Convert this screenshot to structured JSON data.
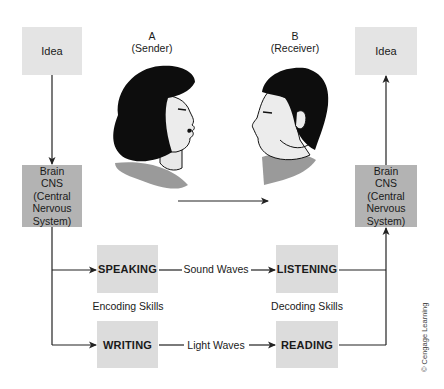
{
  "diagram": {
    "type": "communication-process",
    "sender": {
      "letter": "A",
      "role": "(Sender)"
    },
    "receiver": {
      "letter": "B",
      "role": "(Receiver)"
    },
    "left_column": {
      "idea_label": "Idea",
      "brain_lines": [
        "Brain",
        "CNS",
        "(Central",
        "Nervous",
        "System)"
      ]
    },
    "right_column": {
      "idea_label": "Idea",
      "brain_lines": [
        "Brain",
        "CNS",
        "(Central",
        "Nervous",
        "System)"
      ]
    },
    "encoding": {
      "speaking_label": "SPEAKING",
      "writing_label": "WRITING",
      "skills_label": "Encoding Skills"
    },
    "decoding": {
      "listening_label": "LISTENING",
      "reading_label": "READING",
      "skills_label": "Decoding Skills"
    },
    "channels": {
      "sound_label": "Sound Waves",
      "light_label": "Light Waves"
    },
    "copyright": "© Cengage Learning",
    "colors": {
      "idea_box": "#e4e4e4",
      "brain_box": "#b3b3b3",
      "skill_box": "#dcdcdc",
      "line": "#222222",
      "collar": "#9a9a9a"
    }
  }
}
